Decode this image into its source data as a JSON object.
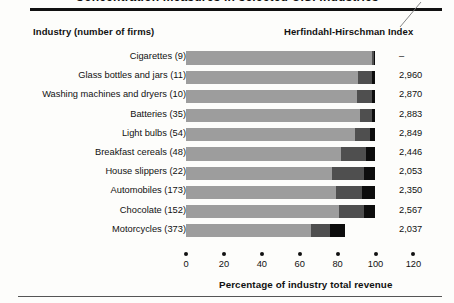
{
  "title_partial": "Concentration measures in selected U.S. industries",
  "headers": {
    "left": "Industry (number of firms)",
    "right": "Herfindahl-Hirschman Index"
  },
  "axis": {
    "title": "Percentage of industry total revenue",
    "ticks": [
      {
        "value": 0,
        "label": "0"
      },
      {
        "value": 20,
        "label": "20"
      },
      {
        "value": 40,
        "label": "40"
      },
      {
        "value": 60,
        "label": "60"
      },
      {
        "value": 80,
        "label": "80"
      },
      {
        "value": 100,
        "label": "100"
      },
      {
        "value": 120,
        "label": "120"
      }
    ]
  },
  "chart_data": {
    "type": "bar",
    "orientation": "horizontal",
    "stacked": true,
    "title": "Concentration measures in selected U.S. industries",
    "xlabel": "Percentage of industry total revenue",
    "ylabel": "",
    "xlim": [
      0,
      125
    ],
    "grid": false,
    "legend": null,
    "categories": [
      "Cigarettes  (9)",
      "Glass bottles and jars  (11)",
      "Washing machines and dryers  (10)",
      "Batteries  (35)",
      "Light bulbs  (54)",
      "Breakfast cereals  (48)",
      "House slippers  (22)",
      "Automobiles  (173)",
      "Chocolate  (152)",
      "Motorcycles  (373)"
    ],
    "series": [
      {
        "name": "Largest 4 firms",
        "color": "#9d9d9d",
        "values": [
          98.0,
          91.0,
          90.0,
          92.0,
          89.0,
          82.0,
          77.0,
          79.0,
          81.0,
          66.0
        ]
      },
      {
        "name": "Next 4 firms (5th-8th)",
        "color": "#4f4f4f",
        "values": [
          1.0,
          7.0,
          8.0,
          6.0,
          8.0,
          13.0,
          17.0,
          14.0,
          13.0,
          10.0
        ]
      },
      {
        "name": "Next 12 firms (9th-20th)",
        "color": "#0d0d0d",
        "values": [
          1.0,
          2.0,
          2.0,
          2.0,
          3.0,
          5.0,
          6.0,
          7.0,
          6.0,
          8.0
        ]
      }
    ],
    "secondary_values": {
      "name": "Herfindahl-Hirschman Index",
      "values": [
        "–",
        "2,960",
        "2,870",
        "2,883",
        "2,849",
        "2,446",
        "2,053",
        "2,350",
        "2,567",
        "2,037"
      ]
    }
  },
  "rows": [
    {
      "label": "Cigarettes  (9)",
      "s1": 98.0,
      "s2": 1.0,
      "s3": 1.0,
      "hhi": "–"
    },
    {
      "label": "Glass bottles and jars  (11)",
      "s1": 91.0,
      "s2": 7.0,
      "s3": 2.0,
      "hhi": "2,960"
    },
    {
      "label": "Washing machines and dryers  (10)",
      "s1": 90.0,
      "s2": 8.0,
      "s3": 2.0,
      "hhi": "2,870"
    },
    {
      "label": "Batteries  (35)",
      "s1": 92.0,
      "s2": 6.0,
      "s3": 2.0,
      "hhi": "2,883"
    },
    {
      "label": "Light bulbs  (54)",
      "s1": 89.0,
      "s2": 8.0,
      "s3": 3.0,
      "hhi": "2,849"
    },
    {
      "label": "Breakfast cereals  (48)",
      "s1": 82.0,
      "s2": 13.0,
      "s3": 5.0,
      "hhi": "2,446"
    },
    {
      "label": "House slippers  (22)",
      "s1": 77.0,
      "s2": 17.0,
      "s3": 6.0,
      "hhi": "2,053"
    },
    {
      "label": "Automobiles  (173)",
      "s1": 79.0,
      "s2": 14.0,
      "s3": 7.0,
      "hhi": "2,350"
    },
    {
      "label": "Chocolate  (152)",
      "s1": 81.0,
      "s2": 13.0,
      "s3": 6.0,
      "hhi": "2,567"
    },
    {
      "label": "Motorcycles  (373)",
      "s1": 66.0,
      "s2": 10.0,
      "s3": 8.0,
      "hhi": "2,037"
    }
  ],
  "colors": {
    "segment_light": "#9d9d9d",
    "segment_mid": "#4f4f4f",
    "segment_dark": "#0d0d0d",
    "rule": "#111111",
    "background": "#fdfdfb"
  }
}
